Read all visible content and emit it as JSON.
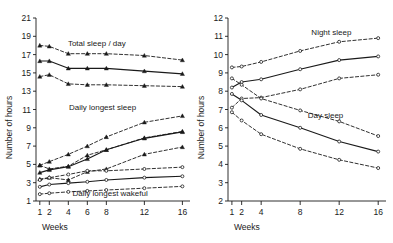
{
  "figure": {
    "background": "#ffffff",
    "line_color": "#1a1a1a",
    "panels": 2
  },
  "chart_data": [
    {
      "type": "line",
      "panel": "left",
      "title": "",
      "xlabel": "Weeks",
      "ylabel": "Number of hours",
      "x": [
        1,
        2,
        4,
        6,
        8,
        12,
        16
      ],
      "xticklabels": [
        "1",
        "2",
        "4",
        "6",
        "8",
        "12",
        "16"
      ],
      "xlim": [
        0.6,
        16.8
      ],
      "ylim": [
        1,
        21
      ],
      "yticks": [
        1,
        3,
        5,
        7,
        9,
        11,
        13,
        15,
        17,
        19,
        21
      ],
      "yticklabels": [
        "1",
        "3",
        "5",
        "7",
        "9",
        "11",
        "13",
        "15",
        "17",
        "19",
        "21"
      ],
      "grid": false,
      "legend": "none",
      "annotations": [
        {
          "text": "Total sleep / day",
          "x": 7.0,
          "y": 17.9
        },
        {
          "text": "Daily longest sleep",
          "x": 7.6,
          "y": 11.0
        },
        {
          "text": "Daily longest wakeful",
          "x": 8.4,
          "y": 1.6
        }
      ],
      "series": [
        {
          "name": "Total sleep/day upper",
          "style": "dashed",
          "marker": "triangle-up",
          "values": [
            18.0,
            17.9,
            17.1,
            17.1,
            17.1,
            16.9,
            16.4
          ]
        },
        {
          "name": "Total sleep/day mean",
          "style": "solid",
          "marker": "triangle-up",
          "values": [
            16.3,
            16.3,
            15.5,
            15.5,
            15.5,
            15.2,
            14.9
          ]
        },
        {
          "name": "Total sleep/day lower",
          "style": "dashed",
          "marker": "triangle-up",
          "values": [
            14.6,
            14.8,
            13.8,
            13.7,
            13.7,
            13.6,
            13.5
          ]
        },
        {
          "name": "Daily longest sleep upper",
          "style": "dashed",
          "marker": "triangle-up",
          "values": [
            4.9,
            4.5,
            4.8,
            6.0,
            6.6,
            7.9,
            8.6
          ]
        },
        {
          "name": "Daily longest sleep mean",
          "style": "solid",
          "marker": "triangle-up",
          "values": [
            4.1,
            4.4,
            4.75,
            5.6,
            6.6,
            7.85,
            8.55
          ]
        },
        {
          "name": "Daily longest sleep lower",
          "style": "dashed",
          "marker": "triangle-up",
          "values": [
            3.4,
            3.55,
            3.3,
            4.2,
            4.5,
            6.1,
            6.9
          ]
        },
        {
          "name": "Daily longest sleep band top",
          "style": "dashed",
          "marker": "triangle-up",
          "values": [
            4.9,
            5.3,
            6.1,
            7.0,
            8.0,
            9.6,
            10.3
          ]
        },
        {
          "name": "Daily longest wakeful upper",
          "style": "dashed",
          "marker": "circle-open",
          "values": [
            3.3,
            3.55,
            3.9,
            4.3,
            4.3,
            4.5,
            4.7
          ]
        },
        {
          "name": "Daily longest wakeful mean",
          "style": "solid",
          "marker": "circle-open",
          "values": [
            2.55,
            2.8,
            2.95,
            3.1,
            3.3,
            3.55,
            3.7
          ]
        },
        {
          "name": "Daily longest wakeful lower",
          "style": "dashed",
          "marker": "circle-open",
          "values": [
            1.75,
            1.85,
            2.0,
            2.1,
            2.2,
            2.4,
            2.6
          ]
        }
      ]
    },
    {
      "type": "line",
      "panel": "right",
      "title": "",
      "xlabel": "Weeks",
      "ylabel": "Number of hours",
      "x": [
        1,
        2,
        4,
        8,
        12,
        16
      ],
      "xticklabels": [
        "1",
        "2",
        "4",
        "8",
        "12",
        "16"
      ],
      "xlim": [
        0.6,
        16.8
      ],
      "ylim": [
        2,
        12
      ],
      "yticks": [
        2,
        3,
        4,
        5,
        6,
        7,
        8,
        9,
        10,
        11,
        12
      ],
      "yticklabels": [
        "2",
        "3",
        "4",
        "5",
        "6",
        "7",
        "8",
        "9",
        "10",
        "11",
        "12"
      ],
      "grid": false,
      "legend": "none",
      "annotations": [
        {
          "text": "Night sleep",
          "x": 11.2,
          "y": 11.05
        },
        {
          "text": "Day sleep",
          "x": 10.6,
          "y": 6.55
        }
      ],
      "series": [
        {
          "name": "Night sleep upper",
          "style": "dashed",
          "marker": "circle-open",
          "values": [
            9.3,
            9.35,
            9.6,
            10.2,
            10.7,
            10.9
          ]
        },
        {
          "name": "Night sleep mean",
          "style": "solid",
          "marker": "circle-open",
          "values": [
            8.2,
            8.5,
            8.65,
            9.2,
            9.7,
            9.9
          ]
        },
        {
          "name": "Night sleep lower",
          "style": "dashed",
          "marker": "circle-open",
          "values": [
            7.1,
            7.6,
            7.65,
            8.1,
            8.7,
            8.9
          ]
        },
        {
          "name": "Day sleep upper",
          "style": "dashed",
          "marker": "circle-open",
          "values": [
            8.7,
            8.35,
            7.6,
            6.95,
            6.35,
            5.55
          ]
        },
        {
          "name": "Day sleep mean",
          "style": "solid",
          "marker": "circle-open",
          "values": [
            7.85,
            7.5,
            6.7,
            6.0,
            5.25,
            4.7
          ]
        },
        {
          "name": "Day sleep lower",
          "style": "dashed",
          "marker": "circle-open",
          "values": [
            6.85,
            6.4,
            5.65,
            4.85,
            4.25,
            3.8
          ]
        }
      ]
    }
  ]
}
